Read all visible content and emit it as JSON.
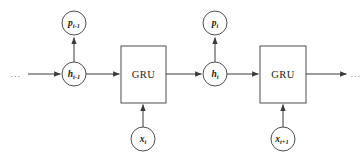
{
  "figure": {
    "type": "diagram",
    "background_color": "#ffffff",
    "stroke_color": "#3a3a3a",
    "text_color": "#1a1a1a"
  },
  "nodes": {
    "prediction_prev": {
      "id": "p-t-minus-1",
      "base": "p",
      "subscript": "t-1",
      "shape": "circle",
      "cx": 74,
      "cy": 23,
      "r": 12
    },
    "hidden_prev": {
      "id": "h-t-minus-1",
      "base": "h",
      "subscript": "t-1",
      "shape": "circle",
      "cx": 74,
      "cy": 74,
      "r": 12
    },
    "cell_left": {
      "id": "gru-cell-left",
      "label": "GRU",
      "shape": "rect",
      "x": 121,
      "y": 46,
      "width": 45,
      "height": 57
    },
    "input_t": {
      "id": "x-t",
      "base": "x",
      "subscript": "t",
      "shape": "circle",
      "cx": 143,
      "cy": 139,
      "r": 12
    },
    "prediction_t": {
      "id": "p-t",
      "base": "p",
      "subscript": "t",
      "shape": "circle",
      "cx": 215,
      "cy": 23,
      "r": 12
    },
    "hidden_t": {
      "id": "h-t",
      "base": "h",
      "subscript": "t",
      "shape": "circle",
      "cx": 215,
      "cy": 74,
      "r": 12
    },
    "cell_right": {
      "id": "gru-cell-right",
      "label": "GRU",
      "shape": "rect",
      "x": 260,
      "y": 46,
      "width": 46,
      "height": 57
    },
    "input_t_next": {
      "id": "x-t-plus-1",
      "base": "x",
      "subscript": "t+1",
      "shape": "circle",
      "cx": 283,
      "cy": 139,
      "r": 12
    }
  },
  "continuation": {
    "left_ellipsis": "...",
    "right_ellipsis": "..."
  },
  "edges": [
    {
      "name": "edge-ellipsis-to-hidden-prev",
      "from": "left-ellipsis",
      "to": "h-t-minus-1",
      "arrow": true
    },
    {
      "name": "edge-hidden-prev-to-prediction-prev",
      "from": "h-t-minus-1",
      "to": "p-t-minus-1",
      "arrow": true
    },
    {
      "name": "edge-hidden-prev-to-cell-left",
      "from": "h-t-minus-1",
      "to": "gru-cell-left",
      "arrow": true
    },
    {
      "name": "edge-input-t-to-cell-left",
      "from": "x-t",
      "to": "gru-cell-left",
      "arrow": true
    },
    {
      "name": "edge-cell-left-to-hidden-t",
      "from": "gru-cell-left",
      "to": "h-t",
      "arrow": true
    },
    {
      "name": "edge-hidden-t-to-prediction-t",
      "from": "h-t",
      "to": "p-t",
      "arrow": true
    },
    {
      "name": "edge-hidden-t-to-cell-right",
      "from": "h-t",
      "to": "gru-cell-right",
      "arrow": true
    },
    {
      "name": "edge-input-t-next-to-cell-right",
      "from": "x-t-plus-1",
      "to": "gru-cell-right",
      "arrow": true
    },
    {
      "name": "edge-cell-right-to-ellipsis",
      "from": "gru-cell-right",
      "to": "right-ellipsis",
      "arrow": true
    }
  ]
}
